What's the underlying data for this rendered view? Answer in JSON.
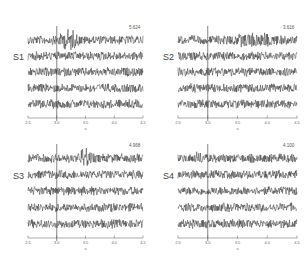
{
  "chart_data": [
    {
      "type": "line",
      "title": "S1",
      "amplitude_label": "5.624",
      "xlabel": "s",
      "xlim": [
        2.5,
        4.5
      ],
      "xticks": [
        "2.5",
        "3.0",
        "3.5",
        "4.0",
        "4.5"
      ],
      "marker_line_x": 3.0,
      "traces": 5,
      "burst": {
        "trace": 0,
        "center": 3.2,
        "width": 0.15,
        "gain": 2.6
      },
      "panel": {
        "x": 28,
        "y": 30,
        "w": 115,
        "h": 92
      }
    },
    {
      "type": "line",
      "title": "S2",
      "amplitude_label": "3.616",
      "xlabel": "s",
      "xlim": [
        2.5,
        4.5
      ],
      "xticks": [
        "2.5",
        "3.0",
        "3.5",
        "4.0",
        "4.5"
      ],
      "marker_line_x": 3.0,
      "traces": 5,
      "burst": {
        "trace": 0,
        "center": 3.8,
        "width": 0.35,
        "gain": 1.9
      },
      "panel": {
        "x": 178,
        "y": 30,
        "w": 119,
        "h": 92
      }
    },
    {
      "type": "line",
      "title": "S3",
      "amplitude_label": "4.968",
      "xlabel": "s",
      "xlim": [
        2.5,
        4.5
      ],
      "xticks": [
        "2.5",
        "3.0",
        "3.5",
        "4.0",
        "4.5"
      ],
      "marker_line_x": 3.0,
      "traces": 5,
      "burst": {
        "trace": 0,
        "center": 3.5,
        "width": 0.08,
        "gain": 3.0
      },
      "panel": {
        "x": 28,
        "y": 148,
        "w": 115,
        "h": 94
      }
    },
    {
      "type": "line",
      "title": "S4",
      "amplitude_label": "4.100",
      "xlabel": "s",
      "xlim": [
        2.5,
        4.5
      ],
      "xticks": [
        "2.5",
        "3.0",
        "3.5",
        "4.0",
        "4.5"
      ],
      "marker_line_x": 3.0,
      "traces": 5,
      "burst": {
        "trace": 0,
        "center": 2.85,
        "width": 0.08,
        "gain": 1.6
      },
      "panel": {
        "x": 178,
        "y": 148,
        "w": 119,
        "h": 94
      }
    }
  ]
}
